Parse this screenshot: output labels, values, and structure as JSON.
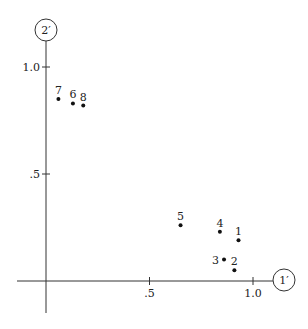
{
  "chart_data": {
    "type": "scatter",
    "title": "",
    "xlabel": "1′",
    "ylabel": "2′",
    "xlim": [
      -0.14,
      1.0
    ],
    "ylim": [
      -0.15,
      1.18
    ],
    "x_ticks": [
      {
        "value": 0.5,
        "label": ".5"
      },
      {
        "value": 1.0,
        "label": "1.0"
      }
    ],
    "y_ticks": [
      {
        "value": 0.5,
        "label": ".5"
      },
      {
        "value": 1.0,
        "label": "1.0"
      }
    ],
    "grid": false,
    "legend": null,
    "points": [
      {
        "label": "1",
        "x": 0.93,
        "y": 0.19
      },
      {
        "label": "2",
        "x": 0.91,
        "y": 0.05
      },
      {
        "label": "3",
        "x": 0.86,
        "y": 0.1
      },
      {
        "label": "4",
        "x": 0.84,
        "y": 0.23
      },
      {
        "label": "5",
        "x": 0.65,
        "y": 0.26
      },
      {
        "label": "6",
        "x": 0.13,
        "y": 0.83
      },
      {
        "label": "7",
        "x": 0.06,
        "y": 0.85
      },
      {
        "label": "8",
        "x": 0.18,
        "y": 0.82
      }
    ]
  },
  "colors": {
    "axis": "#333333",
    "point": "#111111",
    "text": "#222222"
  }
}
